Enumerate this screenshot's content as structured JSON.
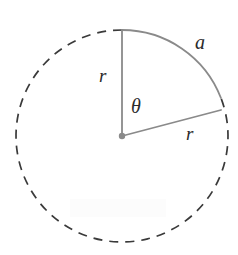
{
  "figure": {
    "type": "geometry-diagram",
    "background_color": "#ffffff",
    "stroke_color": "#8a8a8a",
    "dash_color": "#3a3a3a",
    "label_color": "#2b2b2b",
    "canvas": {
      "width": 238,
      "height": 255
    }
  },
  "circle": {
    "center_x": 122,
    "center_y": 136,
    "radius": 106,
    "solid_arc_start_deg": 21,
    "solid_arc_end_deg": 90,
    "dashed_arc_start_deg": 90,
    "dashed_arc_end_deg": 381,
    "dash_length": 9,
    "dash_gap": 7
  },
  "center_point": {
    "label": "center-dot",
    "x": 122,
    "y": 136,
    "radius": 3.2,
    "color": "#8a8a8a"
  },
  "radii": [
    {
      "name": "vertical-radius",
      "from_x": 122,
      "from_y": 136,
      "to_x": 122,
      "to_y": 30,
      "angle_deg": 90,
      "label": "r"
    },
    {
      "name": "radial-radius",
      "from_x": 122,
      "from_y": 136,
      "to_x": 221,
      "to_y": 110,
      "angle_deg": 21,
      "label": "r"
    }
  ],
  "labels": {
    "radius_vertical": "r",
    "radius_radial": "r",
    "angle": "θ",
    "arc_length": "a"
  },
  "caption": {
    "arc_label_meaning": "a",
    "angle_label_meaning": "θ",
    "radius_label_meaning": "r"
  }
}
